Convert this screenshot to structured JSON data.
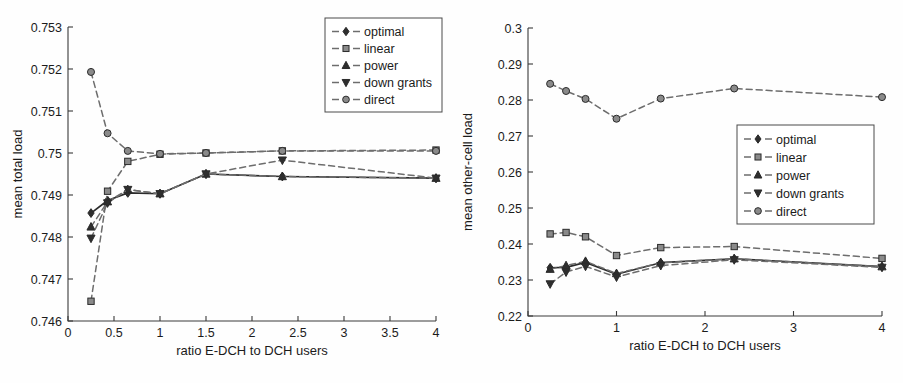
{
  "figure": {
    "panels": [
      {
        "id": "left",
        "axis": {
          "xlabel": "ratio E-DCH to DCH users",
          "ylabel": "mean total load",
          "xticks": [
            "0",
            "0.5",
            "1",
            "1.5",
            "2",
            "2.5",
            "3",
            "3.5",
            "4"
          ],
          "xtickvals": [
            0,
            0.5,
            1,
            1.5,
            2,
            2.5,
            3,
            3.5,
            4
          ],
          "yticks": [
            "0.746",
            "0.747",
            "0.748",
            "0.749",
            "0.75",
            "0.751",
            "0.752",
            "0.753"
          ],
          "ytickvals": [
            0.746,
            0.747,
            0.748,
            0.749,
            0.75,
            0.751,
            0.752,
            0.753
          ]
        },
        "legend": {
          "position": "top-right",
          "entries": [
            {
              "label": "optimal",
              "marker": "diamond",
              "dash": "dashed"
            },
            {
              "label": "linear",
              "marker": "square",
              "dash": "dashed"
            },
            {
              "label": "power",
              "marker": "triangle-up",
              "dash": "dashed"
            },
            {
              "label": "down grants",
              "marker": "triangle-down",
              "dash": "dashed"
            },
            {
              "label": "direct",
              "marker": "circle",
              "dash": "dashed"
            }
          ]
        }
      },
      {
        "id": "right",
        "axis": {
          "xlabel": "ratio E-DCH to DCH users",
          "ylabel": "mean other-cell load",
          "xticks": [
            "0",
            "1",
            "2",
            "3",
            "4"
          ],
          "xtickvals": [
            0,
            1,
            2,
            3,
            4
          ],
          "yticks": [
            "0.22",
            "0.23",
            "0.24",
            "0.25",
            "0.26",
            "0.27",
            "0.28",
            "0.29",
            "0.3"
          ],
          "ytickvals": [
            0.22,
            0.23,
            0.24,
            0.25,
            0.26,
            0.27,
            0.28,
            0.29,
            0.3
          ]
        },
        "legend": {
          "position": "middle-right",
          "entries": [
            {
              "label": "optimal",
              "marker": "diamond",
              "dash": "dashed"
            },
            {
              "label": "linear",
              "marker": "square",
              "dash": "dashed"
            },
            {
              "label": "power",
              "marker": "triangle-up",
              "dash": "dashed"
            },
            {
              "label": "down grants",
              "marker": "triangle-down",
              "dash": "dashed"
            },
            {
              "label": "direct",
              "marker": "circle",
              "dash": "dashed"
            }
          ]
        }
      }
    ]
  },
  "chart_data": [
    {
      "type": "line",
      "panel": "left",
      "title": "",
      "xlabel": "ratio E-DCH to DCH users",
      "ylabel": "mean total load",
      "xlim": [
        0,
        4
      ],
      "ylim": [
        0.746,
        0.753
      ],
      "grid": false,
      "legend_position": "top-right",
      "x": [
        0.25,
        0.43,
        0.65,
        1.0,
        1.5,
        2.33,
        4.0
      ],
      "series": [
        {
          "name": "optimal",
          "marker": "diamond",
          "linestyle": "solid",
          "values": [
            0.74857,
            0.74887,
            0.74905,
            0.74903,
            0.7495,
            0.74944,
            0.7494
          ]
        },
        {
          "name": "linear",
          "marker": "square",
          "linestyle": "dashed",
          "values": [
            0.74647,
            0.74909,
            0.7498,
            0.74997,
            0.75,
            0.75005,
            0.75007
          ]
        },
        {
          "name": "power",
          "marker": "triangle-up",
          "linestyle": "dashed",
          "values": [
            0.74824,
            0.74884,
            0.74913,
            0.74903,
            0.7495,
            0.74944,
            0.7494
          ]
        },
        {
          "name": "down grants",
          "marker": "triangle-down",
          "linestyle": "dashed",
          "values": [
            0.74797,
            0.74881,
            0.74913,
            0.74903,
            0.7495,
            0.74983,
            0.7494
          ]
        },
        {
          "name": "direct",
          "marker": "circle",
          "linestyle": "dashed",
          "values": [
            0.75193,
            0.75047,
            0.75005,
            0.74998,
            0.75,
            0.75005,
            0.75005
          ]
        }
      ]
    },
    {
      "type": "line",
      "panel": "right",
      "title": "",
      "xlabel": "ratio E-DCH to DCH users",
      "ylabel": "mean other-cell load",
      "xlim": [
        0,
        4
      ],
      "ylim": [
        0.22,
        0.3
      ],
      "grid": false,
      "legend_position": "middle-right",
      "x": [
        0.25,
        0.43,
        0.65,
        1.0,
        1.5,
        2.33,
        4.0
      ],
      "series": [
        {
          "name": "optimal",
          "marker": "diamond",
          "linestyle": "solid",
          "values": [
            0.2334,
            0.2335,
            0.2349,
            0.2316,
            0.2348,
            0.2359,
            0.2337
          ]
        },
        {
          "name": "linear",
          "marker": "square",
          "linestyle": "dashed",
          "values": [
            0.2428,
            0.2432,
            0.242,
            0.2368,
            0.239,
            0.2393,
            0.236
          ]
        },
        {
          "name": "power",
          "marker": "triangle-up",
          "linestyle": "dashed",
          "values": [
            0.233,
            0.234,
            0.2352,
            0.2318,
            0.2348,
            0.2359,
            0.2337
          ]
        },
        {
          "name": "down grants",
          "marker": "triangle-down",
          "linestyle": "dashed",
          "values": [
            0.2289,
            0.2322,
            0.2338,
            0.2308,
            0.234,
            0.2356,
            0.2335
          ]
        },
        {
          "name": "direct",
          "marker": "circle",
          "linestyle": "dashed",
          "values": [
            0.2845,
            0.2825,
            0.2803,
            0.2748,
            0.2804,
            0.2832,
            0.2808
          ]
        }
      ]
    }
  ],
  "style": {
    "line_color_dark": "#2b2b2b",
    "line_color_gray": "#6d6d6d",
    "marker_fill_dark": "#2e2e2e",
    "marker_fill_gray": "#8a8a8a",
    "axis_color": "#3a3a3a",
    "background": "#fefefe"
  }
}
